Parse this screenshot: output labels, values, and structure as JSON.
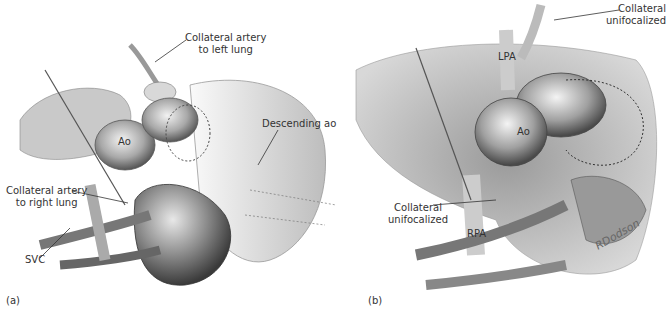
{
  "figure": {
    "panels": [
      {
        "id": "a",
        "panel_label": "(a)",
        "labels": {
          "collateral_left_1": "Collateral artery",
          "collateral_left_2": "to left lung",
          "descending": "Descending ao",
          "ao": "Ao",
          "collateral_right_1": "Collateral artery",
          "collateral_right_2": "to right lung",
          "svc": "SVC"
        }
      },
      {
        "id": "b",
        "panel_label": "(b)",
        "labels": {
          "collateral_top_1": "Collateral",
          "collateral_top_2": "unifocalized",
          "lpa": "LPA",
          "ao": "Ao",
          "collateral_bottom_1": "Collateral",
          "collateral_bottom_2": "unifocalized",
          "rpa": "RPA",
          "signature": "RDodson"
        }
      }
    ]
  }
}
